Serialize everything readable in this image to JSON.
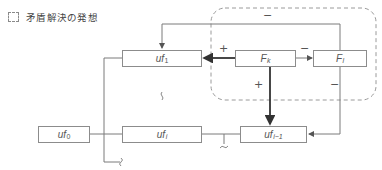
{
  "legend": {
    "icon": "dashed-box-icon",
    "label": "矛盾解決の発想"
  },
  "nodes": {
    "uf1": {
      "main": "uf",
      "sub": "1"
    },
    "fk": {
      "main": "F",
      "sub": "k"
    },
    "fl": {
      "main": "F",
      "sub": "l"
    },
    "uf0": {
      "main": "uf",
      "sub": "0"
    },
    "ufi": {
      "main": "uf",
      "sub": "i"
    },
    "ufi_1": {
      "main": "uf",
      "sub": "i−1"
    }
  },
  "edges": [
    {
      "from": "fl",
      "to": "uf1",
      "sign": "−"
    },
    {
      "from": "fk",
      "to": "uf1",
      "sign": "+"
    },
    {
      "from": "fk",
      "to": "fl",
      "sign": "−"
    },
    {
      "from": "fk",
      "to": "ufi_1",
      "sign": "+"
    },
    {
      "from": "fl",
      "to": "ufi_1",
      "sign": "−"
    }
  ],
  "signs": {
    "top_feedback": "−",
    "fk_to_uf1": "+",
    "fk_to_fl": "−",
    "fk_down": "+",
    "fl_down": "−"
  },
  "colors": {
    "line": "#7a7a7a",
    "strong_arrow": "#444444",
    "dashed_region": "#9a9a9a"
  }
}
